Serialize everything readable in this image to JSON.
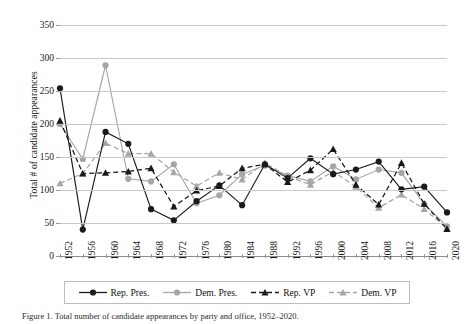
{
  "figure": {
    "caption_fragment": "Figure 1. Total number of candidate appearances by party and office, 1952–2020."
  },
  "chart_data": {
    "type": "line",
    "title": "",
    "xlabel": "",
    "ylabel": "Total # of candidate appearances",
    "categories": [
      "1952",
      "1956",
      "1960",
      "1964",
      "1968",
      "1972",
      "1976",
      "1980",
      "1984",
      "1988",
      "1992",
      "1996",
      "2000",
      "2004",
      "2008",
      "2012",
      "2016",
      "2020"
    ],
    "ylim": [
      0,
      350
    ],
    "yticks": [
      0,
      50,
      100,
      150,
      200,
      250,
      300,
      350
    ],
    "grid": true,
    "legend_position": "bottom",
    "series": [
      {
        "name": "Rep. Pres.",
        "color": "#1a1a1a",
        "marker": "circle",
        "dash": "solid",
        "values": [
          254,
          40,
          188,
          170,
          71,
          54,
          83,
          107,
          77,
          139,
          118,
          148,
          124,
          131,
          143,
          101,
          105,
          66
        ]
      },
      {
        "name": "Dem. Pres.",
        "color": "#a6a6a6",
        "marker": "circle",
        "dash": "solid",
        "values": [
          200,
          147,
          289,
          117,
          113,
          139,
          80,
          92,
          124,
          137,
          122,
          113,
          136,
          116,
          131,
          126,
          79,
          45
        ]
      },
      {
        "name": "Rep. VP",
        "color": "#1a1a1a",
        "marker": "triangle",
        "dash": "dashed",
        "values": [
          205,
          125,
          126,
          128,
          133,
          75,
          99,
          106,
          133,
          139,
          112,
          130,
          162,
          108,
          78,
          141,
          79,
          41
        ]
      },
      {
        "name": "Dem. VP",
        "color": "#a6a6a6",
        "marker": "triangle",
        "dash": "dashed",
        "values": [
          110,
          125,
          171,
          155,
          155,
          127,
          106,
          126,
          116,
          141,
          121,
          108,
          128,
          105,
          73,
          93,
          71,
          42
        ]
      }
    ]
  },
  "legend": {
    "items": [
      {
        "label": "Rep. Pres."
      },
      {
        "label": "Dem. Pres."
      },
      {
        "label": "Rep. VP"
      },
      {
        "label": "Dem. VP"
      }
    ]
  }
}
